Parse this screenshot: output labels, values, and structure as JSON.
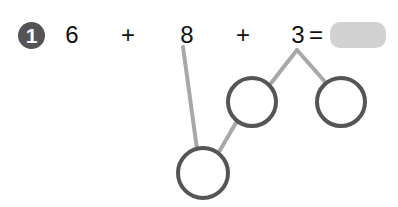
{
  "problem": {
    "number": "1",
    "terms": [
      "6",
      "+",
      "8",
      "+",
      "3",
      "="
    ],
    "answer": ""
  },
  "diagram": {
    "line_color": "#a8a8a8",
    "circle_stroke": "#555555",
    "circles": [
      {
        "id": "top-left",
        "value": ""
      },
      {
        "id": "top-right",
        "value": ""
      },
      {
        "id": "bottom",
        "value": ""
      }
    ]
  },
  "colors": {
    "badge": "#545454",
    "answer_box": "#d2d2d2"
  }
}
